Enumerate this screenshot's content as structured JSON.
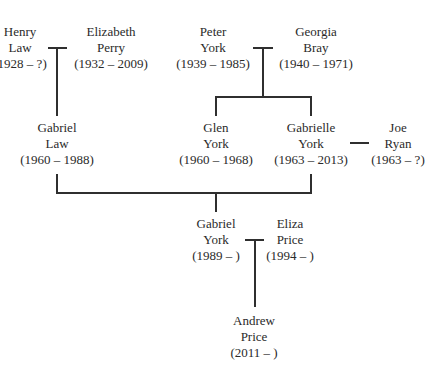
{
  "people": [
    {
      "id": "henry-law",
      "first": "Henry",
      "last": "Law",
      "dates": "(1928 – ?)",
      "x": 20,
      "y": 24
    },
    {
      "id": "elizabeth-perry",
      "first": "Elizabeth",
      "last": "Perry",
      "dates": "(1932 – 2009)",
      "x": 111,
      "y": 24
    },
    {
      "id": "peter-york",
      "first": "Peter",
      "last": "York",
      "dates": "(1939 – 1985)",
      "x": 213,
      "y": 24
    },
    {
      "id": "georgia-bray",
      "first": "Georgia",
      "last": "Bray",
      "dates": "(1940 – 1971)",
      "x": 316,
      "y": 24
    },
    {
      "id": "gabriel-law",
      "first": "Gabriel",
      "last": "Law",
      "dates": "(1960 – 1988)",
      "x": 57,
      "y": 120
    },
    {
      "id": "glen-york",
      "first": "Glen",
      "last": "York",
      "dates": "(1960 – 1968)",
      "x": 216,
      "y": 120
    },
    {
      "id": "gabrielle-york",
      "first": "Gabrielle",
      "last": "York",
      "dates": "(1963 – 2013)",
      "x": 311,
      "y": 120
    },
    {
      "id": "joe-ryan",
      "first": "Joe",
      "last": "Ryan",
      "dates": "(1963 – ?)",
      "x": 398,
      "y": 120
    },
    {
      "id": "gabriel-york",
      "first": "Gabriel",
      "last": "York",
      "dates": "(1989 – )",
      "x": 216,
      "y": 216
    },
    {
      "id": "eliza-price",
      "first": "Eliza",
      "last": "Price",
      "dates": "(1994 – )",
      "x": 290,
      "y": 216
    },
    {
      "id": "andrew-price",
      "first": "Andrew",
      "last": "Price",
      "dates": "(2011 – )",
      "x": 254,
      "y": 313
    }
  ],
  "relationships": [
    {
      "type": "marriage",
      "a": "henry-law",
      "b": "elizabeth-perry"
    },
    {
      "type": "marriage",
      "a": "peter-york",
      "b": "georgia-bray"
    },
    {
      "type": "marriage",
      "a": "gabrielle-york",
      "b": "joe-ryan"
    },
    {
      "type": "marriage",
      "a": "gabriel-york",
      "b": "eliza-price"
    },
    {
      "type": "child",
      "parents": [
        "henry-law",
        "elizabeth-perry"
      ],
      "child": "gabriel-law"
    },
    {
      "type": "child",
      "parents": [
        "peter-york",
        "georgia-bray"
      ],
      "child": "glen-york"
    },
    {
      "type": "child",
      "parents": [
        "peter-york",
        "georgia-bray"
      ],
      "child": "gabrielle-york"
    },
    {
      "type": "child",
      "parents": [
        "gabriel-law",
        "gabrielle-york"
      ],
      "child": "gabriel-york"
    },
    {
      "type": "child",
      "parents": [
        "gabriel-york",
        "eliza-price"
      ],
      "child": "andrew-price"
    }
  ]
}
